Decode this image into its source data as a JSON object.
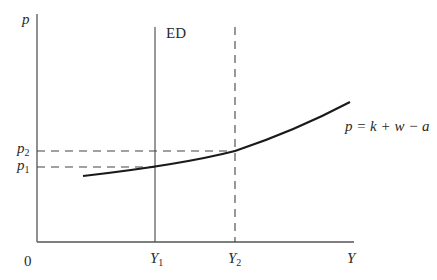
{
  "diagram": {
    "y_axis_label": "p",
    "x_axis_label": "Y",
    "origin_label": "0",
    "vertical_line_label": "ED",
    "price_levels": [
      {
        "symbol": "p",
        "sub": "2"
      },
      {
        "symbol": "p",
        "sub": "1"
      }
    ],
    "output_levels": [
      {
        "symbol": "Y",
        "sub": "1"
      },
      {
        "symbol": "Y",
        "sub": "2"
      }
    ],
    "curve_label": "p = k + w − a",
    "colors": {
      "axis": "#555555",
      "curve": "#1a1a1a",
      "dashed": "#444444"
    }
  }
}
